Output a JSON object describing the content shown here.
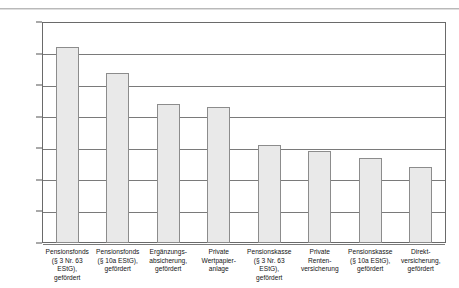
{
  "chart_data": {
    "type": "bar",
    "title": "",
    "subtitle": "",
    "xlabel": "",
    "ylabel": "",
    "ylim": [
      2.3,
      3.0
    ],
    "ytick_labels": [
      "3",
      "2,9",
      "2,8",
      "2,7",
      "2,6",
      "2,5",
      "2,4",
      "2,3"
    ],
    "ytick_values": [
      3.0,
      2.9,
      2.8,
      2.7,
      2.6,
      2.5,
      2.4,
      2.3
    ],
    "grid": true,
    "legend": "none",
    "categories": [
      "Pensionsfonds\n(§ 3 Nr. 63 EStG),\ngefördert",
      "Pensionsfonds\n(§ 10a EStG),\ngefördert",
      "Ergänzungs-\nabsicherung,\ngefördert",
      "Private\nWertpapier-\nanlage",
      "Pensionskasse\n(§ 3 Nr. 63 EStG),\ngefördert",
      "Private\nRenten-\nversicherung",
      "Pensionskasse\n(§ 10a EStG),\ngefördert",
      "Direkt-\nversicherung,\ngefördert"
    ],
    "values": [
      2.92,
      2.84,
      2.74,
      2.73,
      2.61,
      2.59,
      2.57,
      2.54
    ],
    "bar_fill": "#e9e9e9",
    "bar_border": "#8c8c8c",
    "grid_color": "#7a7a7a",
    "axis_color": "#6a6a6a"
  }
}
